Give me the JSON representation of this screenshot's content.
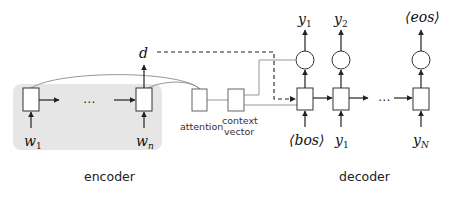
{
  "diagram": {
    "type": "encoder-decoder with attention",
    "encoder": {
      "label": "encoder",
      "inputs": [
        {
          "base": "w",
          "sub": "1"
        },
        {
          "base": "w",
          "sub": "n"
        }
      ],
      "ellipsis": "…",
      "output": "d"
    },
    "attention": {
      "label": "attention"
    },
    "context": {
      "label_line1": "context",
      "label_line2": "vector"
    },
    "decoder": {
      "label": "decoder",
      "ellipsis": "…",
      "inputs": [
        {
          "text": "⟨bos⟩"
        },
        {
          "base": "y",
          "sub": "1"
        },
        {
          "base": "y",
          "sub": "N"
        }
      ],
      "outputs": [
        {
          "base": "y",
          "sub": "1"
        },
        {
          "base": "y",
          "sub": "2"
        },
        {
          "text": "⟨eos⟩"
        }
      ]
    },
    "colors": {
      "encoder_bg": "#e6e6e6",
      "stroke": "#333333",
      "thin_line": "#8a8a8a"
    }
  }
}
